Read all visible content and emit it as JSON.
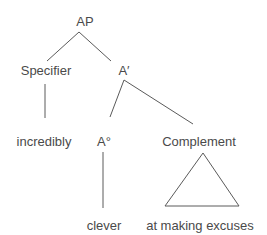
{
  "diagram": {
    "type": "syntax-tree",
    "nodes": {
      "root": "AP",
      "specifier": "Specifier",
      "a_bar": "A′",
      "specifier_word": "incredibly",
      "head": "A°",
      "complement": "Complement",
      "head_word": "clever",
      "complement_phrase": "at making excuses"
    },
    "edges": [
      [
        "AP",
        "Specifier"
      ],
      [
        "AP",
        "A′"
      ],
      [
        "Specifier",
        "incredibly"
      ],
      [
        "A′",
        "A°"
      ],
      [
        "A′",
        "Complement"
      ],
      [
        "A°",
        "clever"
      ],
      [
        "Complement",
        "at making excuses (triangle)"
      ]
    ],
    "line_color": "#5a5a5a",
    "text_color": "#4a4a4a"
  }
}
